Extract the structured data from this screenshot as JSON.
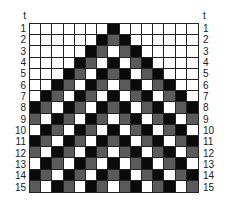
{
  "diagram": {
    "top_label": "t",
    "row_labels": [
      "1",
      "2",
      "3",
      "4",
      "5",
      "6",
      "7",
      "8",
      "9",
      "10",
      "11",
      "12",
      "13",
      "14",
      "15"
    ],
    "columns": 15,
    "rows": 15,
    "colors": {
      "W": "#ffffff",
      "B": "#0a0a0a",
      "G": "#5a5a5a"
    },
    "legend_states": {
      "W": "white",
      "B": "black",
      "G": "gray"
    },
    "cells": [
      "WWWWWWWBWWWWWWW",
      "WWWWWWBGBWWWWWW",
      "WWWWWBGWGBWWWWW",
      "WWWWBGWBWGBWWWW",
      "WWWBGWBGBWGBWWW",
      "WWBGWBGWGBWGBWW",
      "WBGWBGWBWGBWGBW",
      "BGWBGWBGBWGBWGB",
      "GWBGWBGWGBWGBWG",
      "WBGWBGWBWGBWGBW",
      "BGWBGWBGBWGBWGB",
      "GWBGWBGWGBWGBWG",
      "WBGWBGWBWGBWGBW",
      "BGWBGWBGBWGBWGB",
      "GWBGWBGWGBWGBWG"
    ]
  }
}
